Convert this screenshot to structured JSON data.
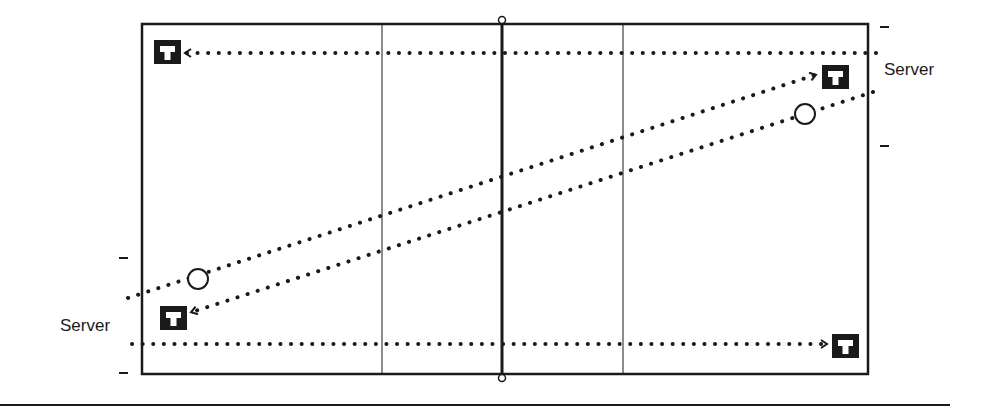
{
  "diagram": {
    "type": "tennis-court-serve-diagram",
    "labels": {
      "server_right": "Server",
      "server_left": "Server",
      "target_glyph": "T"
    },
    "colors": {
      "ink": "#1a1a1a",
      "background": "#ffffff"
    },
    "elements": {
      "targets": [
        {
          "name": "target-top-left",
          "x": 168,
          "y": 52
        },
        {
          "name": "target-top-right",
          "x": 830,
          "y": 77
        },
        {
          "name": "target-bottom-left",
          "x": 172,
          "y": 318
        },
        {
          "name": "target-bottom-right",
          "x": 845,
          "y": 346
        }
      ],
      "balls": [
        {
          "name": "ball-left",
          "x": 198,
          "y": 279
        },
        {
          "name": "ball-right",
          "x": 805,
          "y": 114
        }
      ]
    }
  }
}
